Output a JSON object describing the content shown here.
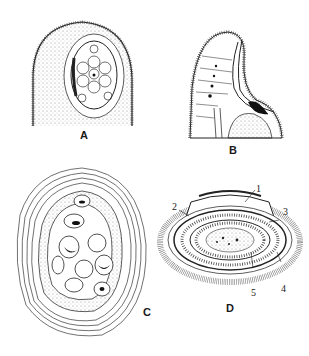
{
  "figures": {
    "a": {
      "label": "A"
    },
    "b": {
      "label": "B"
    },
    "c": {
      "label": "C"
    },
    "d": {
      "label": "D",
      "callouts": [
        "1",
        "2",
        "3",
        "4",
        "5"
      ]
    }
  },
  "colors": {
    "ink": "#1a1a1a",
    "paper": "#ffffff",
    "stipple": "#888888"
  }
}
